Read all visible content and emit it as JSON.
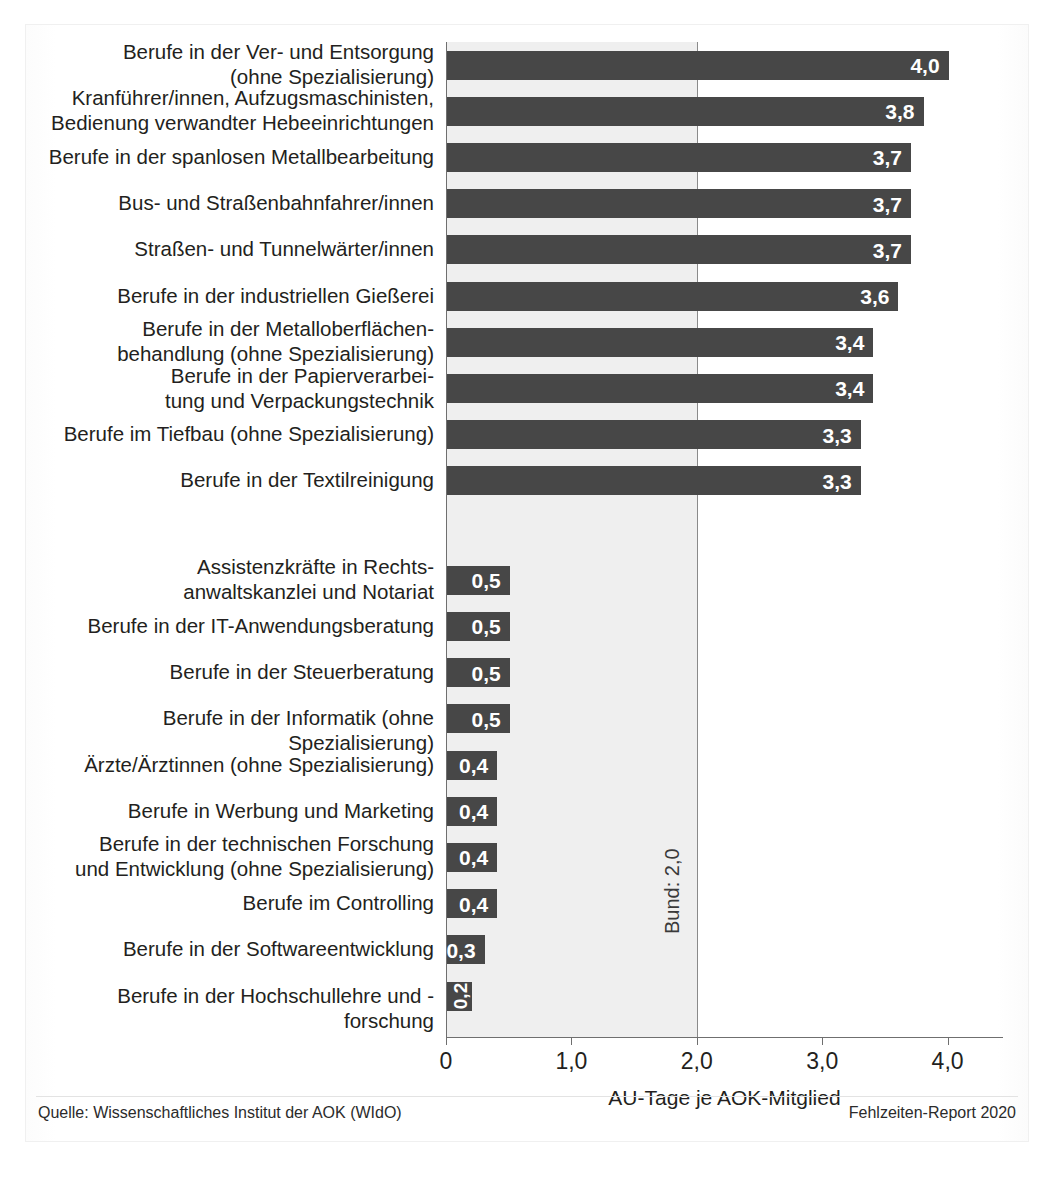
{
  "chart_data": {
    "type": "bar",
    "orientation": "horizontal",
    "title": "",
    "xlabel": "AU-Tage je AOK-Mitglied",
    "ylabel": "",
    "xlim": [
      0,
      4.45
    ],
    "xticks": [
      "0",
      "1,0",
      "2,0",
      "3,0",
      "4,0"
    ],
    "xtick_values": [
      0,
      1.0,
      2.0,
      3.0,
      4.0
    ],
    "grid": false,
    "legend": "none",
    "reference_line": {
      "label": "Bund: 2,0",
      "value": 2.0
    },
    "value_format": "German decimal comma, one decimal place",
    "categories": [
      "Berufe in der Ver- und Entsorgung\n(ohne Spezialisierung)",
      "Kranführer/innen, Aufzugsmaschinisten,\nBedienung verwandter Hebeeinrichtungen",
      "Berufe in der spanlosen Metallbearbeitung",
      "Bus- und Straßenbahnfahrer/innen",
      "Straßen- und Tunnelwärter/innen",
      "Berufe in der industriellen Gießerei",
      "Berufe in der Metalloberflächen-\nbehandlung (ohne Spezialisierung)",
      "Berufe in der Papierverarbei-\ntung und Verpackungstechnik",
      "Berufe im Tiefbau (ohne Spezialisierung)",
      "Berufe in der Textilreinigung",
      "Assistenzkräfte in Rechts-\nanwaltskanzlei und Notariat",
      "Berufe in der IT-Anwendungsberatung",
      "Berufe in der Steuerberatung",
      "Berufe in der Informatik (ohne Spezialisierung)",
      "Ärzte/Ärztinnen (ohne Spezialisierung)",
      "Berufe in Werbung und Marketing",
      "Berufe in der technischen Forschung\nund Entwicklung (ohne Spezialisierung)",
      "Berufe im Controlling",
      "Berufe in der Softwareentwicklung",
      "Berufe in der Hochschullehre und -forschung"
    ],
    "values": [
      4.0,
      3.8,
      3.7,
      3.7,
      3.7,
      3.6,
      3.4,
      3.4,
      3.3,
      3.3,
      0.5,
      0.5,
      0.5,
      0.5,
      0.4,
      0.4,
      0.4,
      0.4,
      0.3,
      0.2
    ],
    "value_labels": [
      "4,0",
      "3,8",
      "3,7",
      "3,7",
      "3,7",
      "3,6",
      "3,4",
      "3,4",
      "3,3",
      "3,3",
      "0,5",
      "0,5",
      "0,5",
      "0,5",
      "0,4",
      "0,4",
      "0,4",
      "0,4",
      "0,3",
      "0,2"
    ],
    "groups": [
      {
        "name": "hoechste",
        "from": 0,
        "to": 9
      },
      {
        "name": "niedrigste",
        "from": 10,
        "to": 19
      }
    ],
    "colors": {
      "bar": "#474747",
      "band": "#efefef",
      "axis": "#6f6f6f",
      "value_text": "#ffffff",
      "text": "#231f20"
    }
  },
  "footer": {
    "source": "Quelle: Wissenschaftliches Institut der AOK (WIdO)",
    "report": "Fehlzeiten-Report 2020"
  }
}
